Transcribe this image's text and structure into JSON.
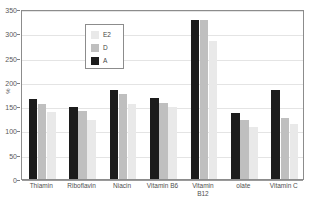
{
  "chart_data": {
    "type": "bar",
    "title": "",
    "subtitle": "",
    "xlabel": "",
    "ylabel": "%",
    "ylim": [
      0,
      350
    ],
    "ytick_step": 50,
    "yticks": [
      0,
      50,
      100,
      150,
      200,
      250,
      300,
      350
    ],
    "ytick_labels": [
      "0",
      "50",
      "100",
      "150",
      "200",
      "250",
      "300",
      "350"
    ],
    "grid": true,
    "grid_axis": "y",
    "legend_position": "upper-left-inside",
    "orientation": "vertical",
    "grouping": "grouped",
    "categories": [
      "Thiamin",
      "Riboflavin",
      "Niacin",
      "Vitamin B6",
      "Vitamin\nB12",
      "olate",
      "Vitamin C"
    ],
    "series": [
      {
        "name": "A",
        "color": "#1c1c1c",
        "values": [
          165,
          148,
          183,
          167,
          327,
          135,
          183
        ]
      },
      {
        "name": "D",
        "color": "#bfbfbf",
        "values": [
          155,
          141,
          175,
          157,
          327,
          121,
          125
        ]
      },
      {
        "name": "E2",
        "color": "#e9e9e9",
        "values": [
          138,
          122,
          155,
          149,
          285,
          108,
          114
        ]
      }
    ],
    "series_draw_order": [
      "A",
      "D",
      "E2"
    ],
    "annotations": []
  },
  "legend": {
    "entries": [
      {
        "label": "E2",
        "color": "#e9e9e9"
      },
      {
        "label": "D",
        "color": "#bfbfbf"
      },
      {
        "label": "A",
        "color": "#1c1c1c"
      }
    ]
  },
  "axes": {
    "y_title": "%"
  },
  "colors": {
    "series_a": "#1c1c1c",
    "series_d": "#bfbfbf",
    "series_e2": "#e9e9e9",
    "frame": "#8c8c8c",
    "gridline": "#e4e4e4",
    "text": "#4f4f4f",
    "background": "#ffffff"
  }
}
